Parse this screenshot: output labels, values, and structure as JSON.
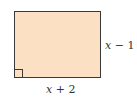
{
  "diagram": {
    "shape": "rectangle",
    "fill_color": "#fbe0c4",
    "stroke_color": "#3a3a3a",
    "right_angle_marker": "bottom-left",
    "labels": {
      "height": {
        "variable": "x",
        "rest": " − 1"
      },
      "width": {
        "variable": "x",
        "rest": " + 2"
      }
    }
  }
}
